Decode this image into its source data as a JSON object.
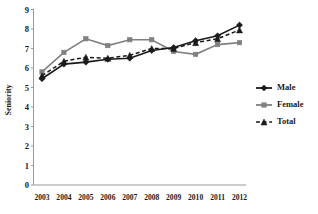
{
  "chart_data": {
    "type": "line",
    "title": "",
    "xlabel": "",
    "ylabel": "Seniority",
    "categories": [
      "2003",
      "2004",
      "2005",
      "2006",
      "2007",
      "2008",
      "2009",
      "2010",
      "2011",
      "2012"
    ],
    "ylim": [
      0,
      9
    ],
    "yticks": [
      "0",
      "1",
      "2",
      "3",
      "4",
      "5",
      "6",
      "7",
      "8",
      "9"
    ],
    "grid": false,
    "legend_position": "right",
    "series": [
      {
        "name": "Male",
        "color": "#1a1a1a",
        "marker": "diamond",
        "dash": "solid",
        "values": [
          5.45,
          6.2,
          6.3,
          6.45,
          6.5,
          6.9,
          7.05,
          7.4,
          7.65,
          8.2
        ]
      },
      {
        "name": "Female",
        "color": "#808080",
        "marker": "square",
        "dash": "solid",
        "values": [
          5.8,
          6.8,
          7.5,
          7.15,
          7.45,
          7.45,
          6.85,
          6.7,
          7.2,
          7.3
        ]
      },
      {
        "name": "Total",
        "color": "#1a1a1a",
        "marker": "triangle",
        "dash": "dashed",
        "values": [
          5.6,
          6.35,
          6.55,
          6.5,
          6.65,
          7.0,
          7.0,
          7.3,
          7.5,
          7.95
        ]
      }
    ]
  },
  "legend": {
    "items": [
      {
        "label": "Male"
      },
      {
        "label": "Female"
      },
      {
        "label": "Total"
      }
    ]
  }
}
